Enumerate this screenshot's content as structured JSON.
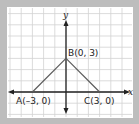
{
  "diagram": {
    "type": "coordinate-plane",
    "grid": {
      "visible": true,
      "color": "#d0d0d0",
      "unit_px": 11.2
    },
    "axes": {
      "x_label": "x",
      "y_label": "y",
      "color": "#222222"
    },
    "points": [
      {
        "id": "A",
        "label": "A(–3, 0)",
        "x": -3,
        "y": 0
      },
      {
        "id": "B",
        "label": "B(0, 3)",
        "x": 0,
        "y": 3
      },
      {
        "id": "C",
        "label": "C(3, 0)",
        "x": 3,
        "y": 0
      }
    ],
    "segments": [
      {
        "from": "A",
        "to": "B",
        "color": "#5a5a5a"
      },
      {
        "from": "B",
        "to": "C",
        "color": "#5a5a5a"
      }
    ],
    "colors": {
      "frame": "#bdbdbd",
      "panel": "#ffffff"
    }
  }
}
